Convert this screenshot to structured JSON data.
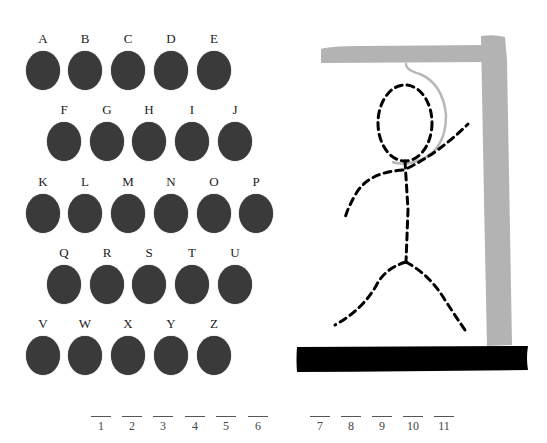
{
  "keyboard": {
    "rows": [
      {
        "keys": [
          {
            "letter": "A",
            "x": 25,
            "y": 32
          },
          {
            "letter": "B",
            "x": 67,
            "y": 32
          },
          {
            "letter": "C",
            "x": 110,
            "y": 32
          },
          {
            "letter": "D",
            "x": 153,
            "y": 32
          },
          {
            "letter": "E",
            "x": 196,
            "y": 32
          }
        ]
      },
      {
        "keys": [
          {
            "letter": "F",
            "x": 46,
            "y": 103
          },
          {
            "letter": "G",
            "x": 89,
            "y": 103
          },
          {
            "letter": "H",
            "x": 131,
            "y": 103
          },
          {
            "letter": "I",
            "x": 174,
            "y": 103
          },
          {
            "letter": "J",
            "x": 217,
            "y": 103
          }
        ]
      },
      {
        "keys": [
          {
            "letter": "K",
            "x": 25,
            "y": 175
          },
          {
            "letter": "L",
            "x": 67,
            "y": 175
          },
          {
            "letter": "M",
            "x": 110,
            "y": 175
          },
          {
            "letter": "N",
            "x": 153,
            "y": 175
          },
          {
            "letter": "O",
            "x": 196,
            "y": 175
          },
          {
            "letter": "P",
            "x": 238,
            "y": 175
          }
        ]
      },
      {
        "keys": [
          {
            "letter": "Q",
            "x": 46,
            "y": 246
          },
          {
            "letter": "R",
            "x": 89,
            "y": 246
          },
          {
            "letter": "S",
            "x": 131,
            "y": 246
          },
          {
            "letter": "T",
            "x": 174,
            "y": 246
          },
          {
            "letter": "U",
            "x": 217,
            "y": 246
          }
        ]
      },
      {
        "keys": [
          {
            "letter": "V",
            "x": 25,
            "y": 317
          },
          {
            "letter": "W",
            "x": 67,
            "y": 317
          },
          {
            "letter": "X",
            "x": 110,
            "y": 317
          },
          {
            "letter": "Y",
            "x": 153,
            "y": 317
          },
          {
            "letter": "Z",
            "x": 196,
            "y": 317
          }
        ]
      }
    ],
    "key_color": "#3a3a3a"
  },
  "word": {
    "blanks": [
      {
        "num": "1",
        "x": 89
      },
      {
        "num": "2",
        "x": 120
      },
      {
        "num": "3",
        "x": 151
      },
      {
        "num": "4",
        "x": 183
      },
      {
        "num": "5",
        "x": 214
      },
      {
        "num": "6",
        "x": 246
      },
      {
        "num": "7",
        "x": 308
      },
      {
        "num": "8",
        "x": 339
      },
      {
        "num": "9",
        "x": 370
      },
      {
        "num": "10",
        "x": 401
      },
      {
        "num": "11",
        "x": 432
      }
    ],
    "y": 416
  },
  "gallows": {
    "beam_color": "#b3b3b3",
    "base_color": "#000000",
    "rope_color": "#b8b8b8",
    "figure_color": "#000000",
    "figure_parts_drawn": [
      "head",
      "body",
      "left-arm",
      "right-arm",
      "left-leg",
      "right-leg"
    ]
  }
}
